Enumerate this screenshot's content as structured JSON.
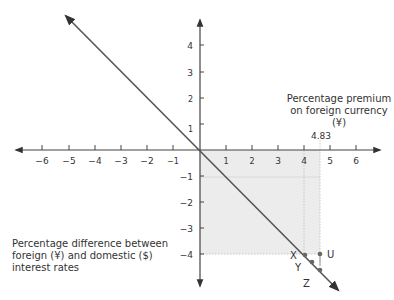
{
  "diagram": {
    "type": "interest-rate-parity-line",
    "x_axis": {
      "title": "Percentage premium on foreign currency (¥)",
      "ticks": [
        "−6",
        "−5",
        "−4",
        "−3",
        "−2",
        "−1",
        "1",
        "2",
        "3",
        "4",
        "5",
        "6"
      ],
      "marked_value": "4.83"
    },
    "y_axis": {
      "title": "Percentage difference between foreign (¥) and domestic ($) interest rates",
      "ticks_positive": [
        "1",
        "2",
        "3",
        "4"
      ],
      "ticks_negative": [
        "−1",
        "−2",
        "−3",
        "−4"
      ]
    },
    "points": {
      "x": "X",
      "y": "Y",
      "z": "Z",
      "u": "U"
    },
    "colors": {
      "axis": "#444444",
      "line": "#555555",
      "shade": "#ececec",
      "dots": "#666666"
    }
  }
}
